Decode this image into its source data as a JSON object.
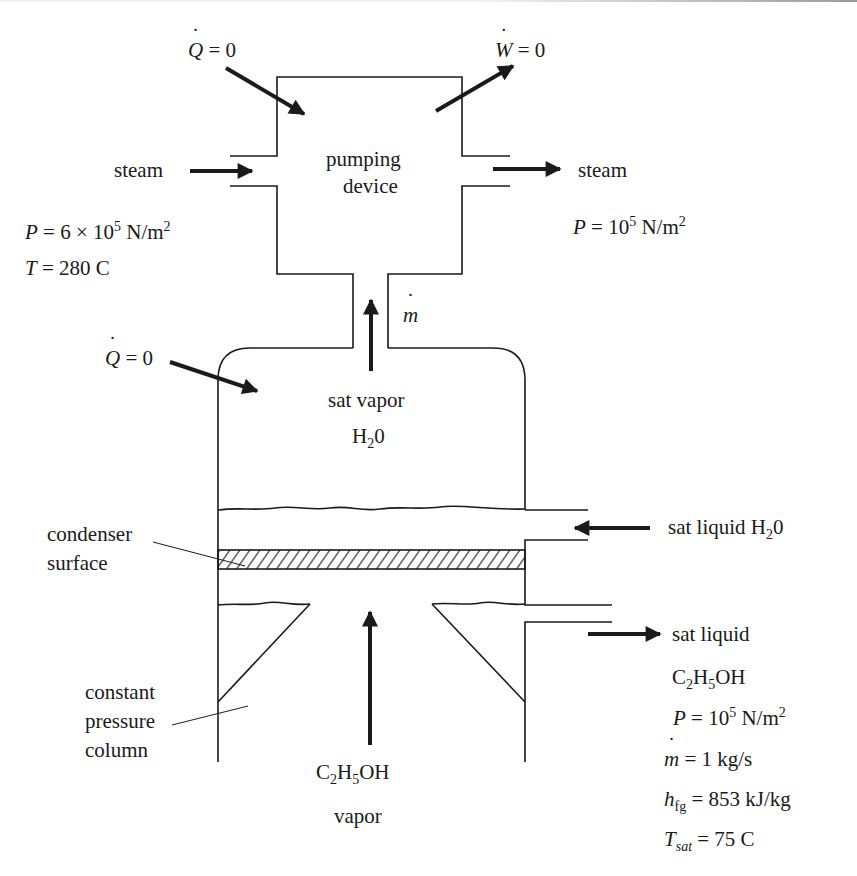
{
  "figure": {
    "type": "thermodynamic system schematic",
    "line_color": "#1a1a1a",
    "background": "#ffffff"
  },
  "pump": {
    "label_line1": "pumping",
    "label_line2": "device",
    "heat": {
      "symbol": "Q",
      "equals": "= 0"
    },
    "work": {
      "symbol": "W",
      "equals": "= 0"
    }
  },
  "steam_in": {
    "label": "steam",
    "pressure": {
      "symbol": "P",
      "text": "= 6 × 10",
      "exp": "5",
      "unit": " N/m",
      "unit_exp": "2"
    },
    "temperature": {
      "symbol": "T",
      "text": "= 280 C"
    }
  },
  "steam_out": {
    "label": "steam",
    "pressure": {
      "symbol": "P",
      "text": "= 10",
      "exp": "5",
      "unit": " N/m",
      "unit_exp": "2"
    }
  },
  "neck": {
    "flow_symbol": "m"
  },
  "chamber": {
    "heat": {
      "symbol": "Q",
      "equals": "= 0"
    },
    "vapor_label_line1": "sat vapor",
    "vapor_label_h": "H",
    "vapor_label_sub": "2",
    "vapor_label_tail": "0"
  },
  "water_inlet": {
    "label": "sat liquid H",
    "sub": "2",
    "tail": "0"
  },
  "condenser": {
    "label_line1": "condenser",
    "label_line2": "surface"
  },
  "column": {
    "label_line1": "constant",
    "label_line2": "pressure",
    "label_line3": "column"
  },
  "ethanol_in": {
    "c": "C",
    "c_sub": "2",
    "h": "H",
    "h_sub": "5",
    "tail": "OH",
    "line2": "vapor"
  },
  "ethanol_out": {
    "line1": "sat liquid",
    "c": "C",
    "c_sub": "2",
    "h": "H",
    "h_sub": "5",
    "tail": "OH",
    "pressure": {
      "symbol": "P",
      "text": "= 10",
      "exp": "5",
      "unit": " N/m",
      "unit_exp": "2"
    },
    "mass_flow": {
      "symbol": "m",
      "text": "= 1 kg/s"
    },
    "hfg": {
      "symbol": "h",
      "sub": "fg",
      "text": "= 853 kJ/kg"
    },
    "tsat": {
      "symbol": "T",
      "sub": "sat",
      "text": "= 75 C"
    }
  }
}
